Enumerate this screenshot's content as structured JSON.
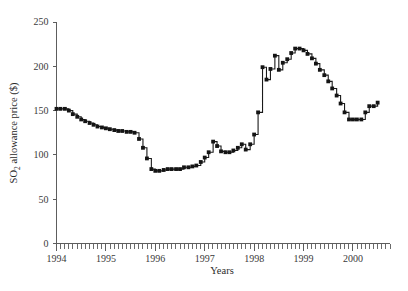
{
  "chart_data": {
    "type": "line",
    "title": "",
    "subtitle": "",
    "xlabel": "Years",
    "ylabel": "SO2 allowance price ($)",
    "ylabel_parts": {
      "prefix": "SO",
      "subscript": "2",
      "suffix": " allowance price ($)"
    },
    "xlim": [
      1994.0,
      2000.75
    ],
    "ylim": [
      0,
      250
    ],
    "grid": false,
    "legend": null,
    "y_ticks": [
      0,
      50,
      100,
      150,
      200,
      250
    ],
    "y_tick_labels": [
      "0",
      "50",
      "100",
      "150",
      "200",
      "250"
    ],
    "x_ticks": [
      1994,
      1995,
      1996,
      1997,
      1998,
      1999,
      2000
    ],
    "x_tick_labels": [
      "1994",
      "1995",
      "1996",
      "1997",
      "1998",
      "1999",
      "2000"
    ],
    "x_minor_tick_interval_months": 1,
    "marker": "square",
    "line_color": "#141414",
    "marker_color": "#141414",
    "axis_color": "#5d5d5d",
    "series": [
      {
        "name": "SO2 allowance price",
        "x": [
          1994.0,
          1994.08,
          1994.17,
          1994.25,
          1994.33,
          1994.42,
          1994.5,
          1994.58,
          1994.67,
          1994.75,
          1994.83,
          1994.92,
          1995.0,
          1995.08,
          1995.17,
          1995.25,
          1995.33,
          1995.42,
          1995.5,
          1995.58,
          1995.67,
          1995.75,
          1995.83,
          1995.92,
          1996.0,
          1996.08,
          1996.17,
          1996.25,
          1996.33,
          1996.42,
          1996.5,
          1996.58,
          1996.67,
          1996.75,
          1996.83,
          1996.92,
          1997.0,
          1997.08,
          1997.17,
          1997.25,
          1997.33,
          1997.42,
          1997.5,
          1997.58,
          1997.67,
          1997.75,
          1997.83,
          1997.92,
          1998.0,
          1998.08,
          1998.17,
          1998.25,
          1998.33,
          1998.42,
          1998.5,
          1998.58,
          1998.67,
          1998.75,
          1998.83,
          1998.92,
          1999.0,
          1999.08,
          1999.17,
          1999.25,
          1999.33,
          1999.42,
          1999.5,
          1999.58,
          1999.67,
          1999.75,
          1999.83,
          1999.92,
          2000.0,
          2000.08,
          2000.17,
          2000.25,
          2000.33,
          2000.42,
          2000.5
        ],
        "values": [
          152,
          152,
          152,
          150,
          146,
          143,
          140,
          138,
          136,
          134,
          132,
          131,
          130,
          129,
          128,
          127,
          127,
          126,
          126,
          125,
          118,
          108,
          96,
          84,
          82,
          82,
          83,
          84,
          84,
          84,
          84,
          86,
          86,
          87,
          88,
          92,
          97,
          103,
          115,
          110,
          104,
          103,
          103,
          105,
          108,
          112,
          106,
          112,
          123,
          148,
          199,
          185,
          197,
          212,
          196,
          204,
          208,
          215,
          220,
          220,
          218,
          214,
          209,
          203,
          196,
          190,
          183,
          175,
          167,
          158,
          148,
          140,
          140,
          140,
          140,
          148,
          155,
          155,
          159
        ]
      }
    ]
  },
  "axis": {
    "y_title_prefix": "SO",
    "y_title_sub": "2",
    "y_title_suffix": " allowance price ($)",
    "x_title": "Years"
  }
}
